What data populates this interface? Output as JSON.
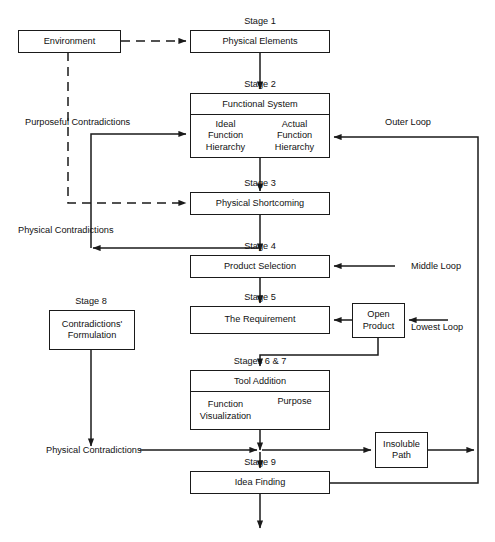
{
  "diagram": {
    "page_header_left": "",
    "page_header_right": "",
    "colors": {
      "stroke": "#1a1a1a",
      "background": "#ffffff",
      "text": "#111111"
    },
    "nodes": {
      "environment": {
        "label": "Environment"
      },
      "physical_elements": {
        "label": "Physical Elements"
      },
      "functional_system": {
        "header": "Functional System",
        "left": "Ideal\nFunction\nHierarchy",
        "left_lines": [
          "Ideal",
          "Function",
          "Hierarchy"
        ],
        "right": "Actual\nFunction\nHierarchy",
        "right_lines": [
          "Actual",
          "Function",
          "Hierarchy"
        ]
      },
      "physical_shortcoming": {
        "label": "Physical Shortcoming"
      },
      "product_selection": {
        "label": "Product Selection"
      },
      "the_requirement": {
        "label": "The Requirement"
      },
      "open_product": {
        "label": "Open\nProduct",
        "lines": [
          "Open",
          "Product"
        ]
      },
      "tool_addition": {
        "header": "Tool Addition",
        "left_lines": [
          "Function",
          "Visualization"
        ],
        "right": "Purpose"
      },
      "contradictions_formulation": {
        "lines": [
          "Contradictions'",
          "Formulation"
        ]
      },
      "insoluble_path": {
        "lines": [
          "Insoluble",
          "Path"
        ]
      },
      "idea_finding": {
        "label": "Idea Finding"
      }
    },
    "stage_labels": {
      "stage1": "Stage 1",
      "stage2": "Stage 2",
      "stage3": "Stage 3",
      "stage4": "Stage 4",
      "stage5": "Stage 5",
      "stage8": "Stage 8",
      "stage67": "Stages 6 & 7",
      "stage9": "Stage 9"
    },
    "edge_labels": {
      "purposeful_contradictions": "Purposeful Contradictions",
      "physical_contradictions_upper": "Physical Contradictions",
      "physical_contradictions_lower": "Physical Contradictions",
      "outer_loop": "Outer Loop",
      "middle_loop": "Middle Loop",
      "lowest_loop": "Lowest Loop"
    }
  }
}
